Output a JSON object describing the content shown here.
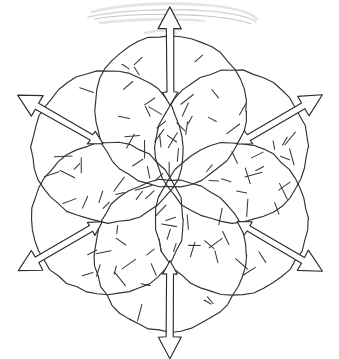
{
  "figure": {
    "caption": "",
    "background_color": "#ffffff",
    "ink_color": "#33312f",
    "smudge_color": "#d9d6d4",
    "canvas": {
      "width": 339,
      "height": 359
    },
    "layout": {
      "center_x": 170,
      "center_y": 183,
      "ring_radius": 72,
      "circle_radius": 76,
      "petal_count": 6,
      "start_angle_deg": -90
    },
    "petals": [
      {
        "id": "petal-top",
        "label": "top",
        "angle_deg": -90,
        "cx": 170,
        "cy": 111,
        "r": 76,
        "arrow": {
          "name": "double-headed-arrow-up",
          "direction": "up",
          "outer_head": "large",
          "inner_head": "small",
          "length": 98
        },
        "hatch_count": 16
      },
      {
        "id": "petal-upper-right",
        "label": "upper-right",
        "angle_deg": -30,
        "cx": 232,
        "cy": 147,
        "r": 76,
        "arrow": {
          "name": "double-headed-arrow-upper-right",
          "direction": "upper-right",
          "outer_head": "large",
          "inner_head": "small",
          "length": 98
        },
        "hatch_count": 16
      },
      {
        "id": "petal-lower-right",
        "label": "lower-right",
        "angle_deg": 30,
        "cx": 232,
        "cy": 219,
        "r": 76,
        "arrow": {
          "name": "double-headed-arrow-lower-right",
          "direction": "lower-right",
          "outer_head": "large",
          "inner_head": "small",
          "length": 98
        },
        "hatch_count": 16
      },
      {
        "id": "petal-bottom",
        "label": "bottom",
        "angle_deg": 90,
        "cx": 170,
        "cy": 255,
        "r": 76,
        "arrow": {
          "name": "double-headed-arrow-down",
          "direction": "down",
          "outer_head": "large",
          "inner_head": "small",
          "length": 98
        },
        "hatch_count": 16
      },
      {
        "id": "petal-lower-left",
        "label": "lower-left",
        "angle_deg": 150,
        "cx": 108,
        "cy": 219,
        "r": 76,
        "arrow": {
          "name": "double-headed-arrow-lower-left",
          "direction": "lower-left",
          "outer_head": "large",
          "inner_head": "small",
          "length": 98
        },
        "hatch_count": 16
      },
      {
        "id": "petal-upper-left",
        "label": "upper-left",
        "angle_deg": -150,
        "cx": 108,
        "cy": 147,
        "r": 76,
        "arrow": {
          "name": "double-headed-arrow-upper-left",
          "direction": "upper-left",
          "outer_head": "large",
          "inner_head": "small",
          "length": 98
        },
        "hatch_count": 16
      }
    ],
    "center_region": {
      "name": "central-hexagonal-void",
      "description": "empty six-sided region formed where the circles fail to overlap"
    },
    "artifacts": [
      {
        "name": "pencil-smudge-top",
        "description": "faint horizontal pencil smudge near the top edge"
      }
    ]
  }
}
